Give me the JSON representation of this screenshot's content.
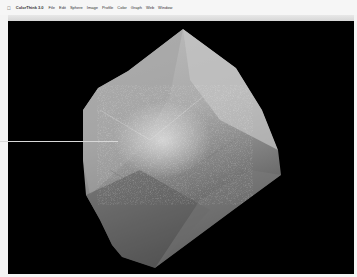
{
  "menubar": {
    "apple_icon": "apple-icon",
    "app_name": "ColorThink 3.0",
    "items": [
      "File",
      "Edit",
      "Sphere",
      "Image",
      "Profile",
      "Color",
      "Graph",
      "Web",
      "Window"
    ]
  },
  "canvas": {
    "background": "#000000",
    "object": "3D gamut hull (grayscale shaded)",
    "shape_colors": {
      "light": "#c8c8c8",
      "mid": "#9a9a9a",
      "dark": "#5e5e5e"
    }
  },
  "pointer_line": {
    "color": "#d8d8d8"
  }
}
